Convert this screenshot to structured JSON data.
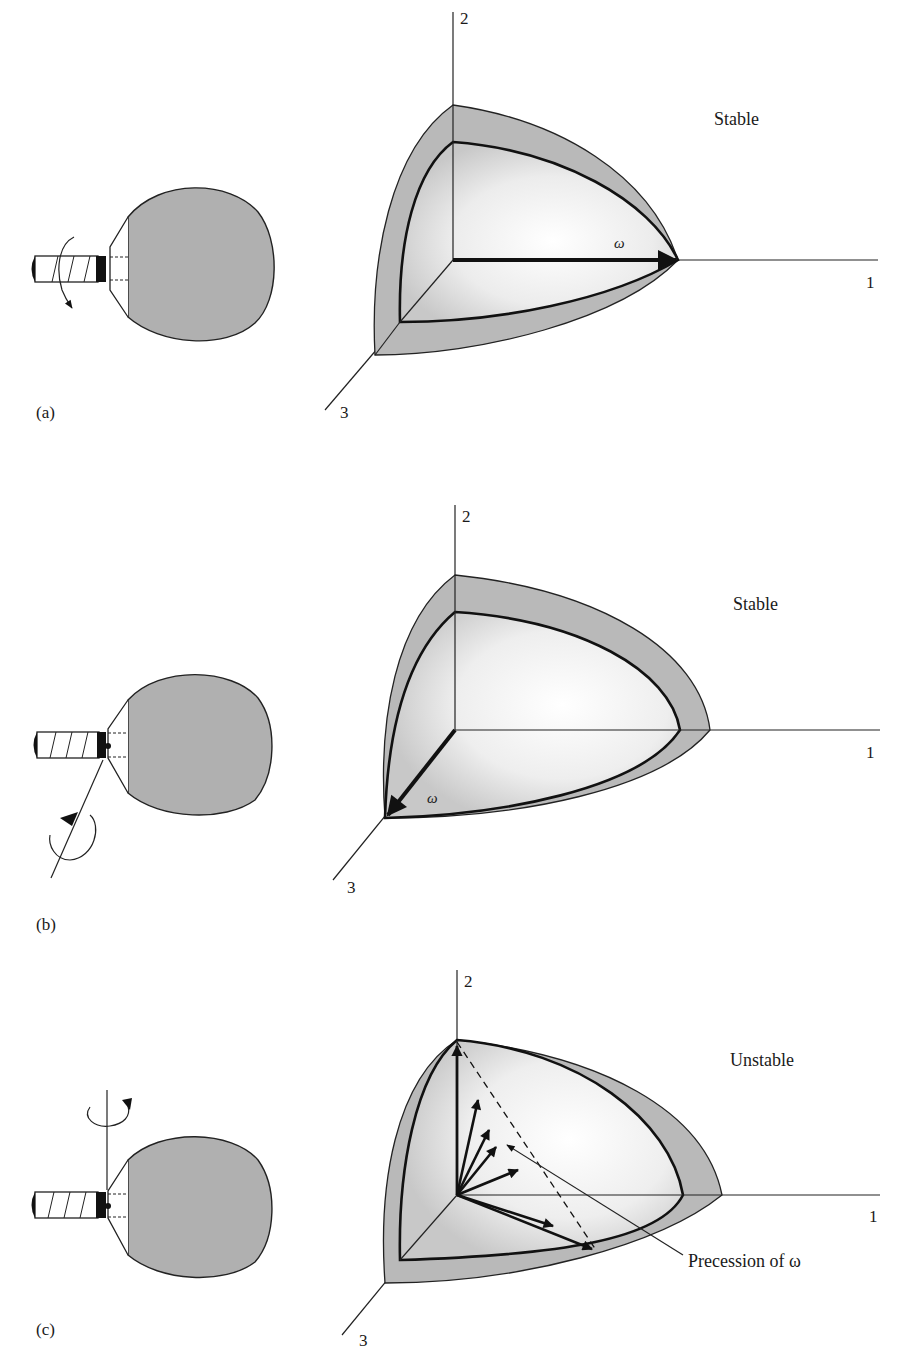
{
  "figure": {
    "panels": [
      {
        "id": "a",
        "label": "(a)",
        "status": "Stable",
        "axes": {
          "axis_1": "1",
          "axis_2": "2",
          "axis_3": "3"
        },
        "omega_label": "ω",
        "rotation_axis": "1 (handle axis)"
      },
      {
        "id": "b",
        "label": "(b)",
        "status": "Stable",
        "axes": {
          "axis_1": "1",
          "axis_2": "2",
          "axis_3": "3"
        },
        "omega_label": "ω",
        "rotation_axis": "3 (normal to paddle face)"
      },
      {
        "id": "c",
        "label": "(c)",
        "status": "Unstable",
        "axes": {
          "axis_1": "1",
          "axis_2": "2",
          "axis_3": "3"
        },
        "annotation": "Precession of ω",
        "rotation_axis": "2 (intermediate axis)"
      }
    ],
    "colors": {
      "ink": "#1a1a1a",
      "shell_gray": "#b9b9b9",
      "paddle_gray": "#b0b0b0",
      "background": "#ffffff"
    }
  }
}
